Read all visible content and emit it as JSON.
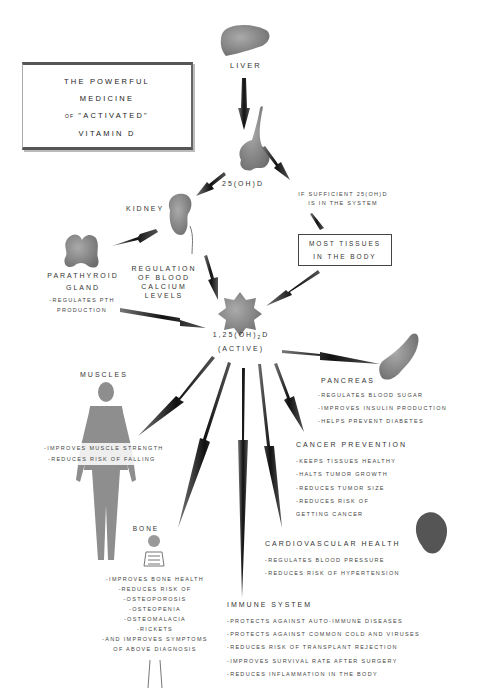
{
  "title": {
    "line1": "THE POWERFUL",
    "line2": "MEDICINE",
    "line3_prefix": "OF",
    "line3": "\"ACTIVATED\"",
    "line4": "VITAMIN D"
  },
  "nodes": {
    "liver": {
      "label": "LIVER"
    },
    "calcidiol": {
      "label": "25(OH)D"
    },
    "sufficient_note": {
      "line1": "IF SUFFICIENT 25(OH)D",
      "line2": "IS IN THE SYSTEM"
    },
    "most_tissues": {
      "line1": "MOST TISSUES",
      "line2": "IN THE BODY"
    },
    "kidney": {
      "label": "KIDNEY"
    },
    "regulation": {
      "line1": "REGULATION",
      "line2": "OF BLOOD",
      "line3": "CALCIUM",
      "line4": "LEVELS"
    },
    "parathyroid": {
      "line1": "PARATHYROID",
      "line2": "GLAND",
      "items": [
        "-REGULATES PTH",
        "PRODUCTION"
      ]
    },
    "active": {
      "line1_pre": "1,25(OH)",
      "line1_sub": "2",
      "line1_post": "D",
      "line2": "(ACTIVE)"
    },
    "pancreas": {
      "label": "PANCREAS",
      "items": [
        "-REGULATES BLOOD SUGAR",
        "-IMPROVES INSULIN PRODUCTION",
        "-HELPS PREVENT DIABETES"
      ]
    },
    "muscles": {
      "label": "MUSCLES",
      "items": [
        "-IMPROVES MUSCLE STRENGTH",
        "-REDUCES RISK OF FALLING"
      ]
    },
    "cancer": {
      "label": "CANCER PREVENTION",
      "items": [
        "-KEEPS TISSUES HEALTHY",
        "-HALTS TUMOR GROWTH",
        "-REDUCES TUMOR SIZE",
        "-REDUCES RISK OF",
        "GETTING CANCER"
      ]
    },
    "cardio": {
      "label": "CARDIOVASCULAR HEALTH",
      "items": [
        "-REGULATES BLOOD PRESSURE",
        "-REDUCES RISK OF HYPERTENSION"
      ]
    },
    "bone": {
      "label": "BONE",
      "items": [
        "-IMPROVES BONE HEALTH",
        "-REDUCES RISK OF",
        "-OSTEOPOROSIS",
        "-OSTEOPENIA",
        "-OSTEOMALACIA",
        "-RICKETS",
        "-AND IMPROVES SYMPTOMS",
        "OF ABOVE DIAGNOSIS"
      ]
    },
    "immune": {
      "label": "IMMUNE SYSTEM",
      "items": [
        "-PROTECTS AGAINST AUTO-IMMUNE DISEASES",
        "-PROTECTS AGAINST COMMON COLD AND VIRUSES",
        "-REDUCES RISK OF TRANSPLANT REJECTION",
        "-IMPROVES SURVIVAL RATE AFTER SURGERY",
        "-REDUCES INFLAMMATION IN THE BODY"
      ]
    }
  },
  "icons": [
    "liver-icon",
    "calcidiol-blob-icon",
    "kidney-icon",
    "parathyroid-icon",
    "active-vitamin-star-icon",
    "pancreas-icon",
    "human-muscle-figure-icon",
    "skeleton-icon",
    "heart-icon"
  ],
  "colors": {
    "text": "#333333",
    "arrow": "#2a2a2a",
    "organ": "#8a8a8a"
  }
}
